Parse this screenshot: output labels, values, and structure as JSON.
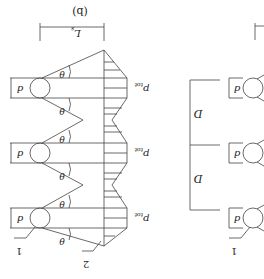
{
  "figure": {
    "orientation": "rotated 180 degrees",
    "panel_label": "(b)",
    "colors": {
      "stroke": "#444444",
      "text": "#222222",
      "background": "#ffffff"
    }
  },
  "panel_b": {
    "spacing_label": "L_s",
    "spacing_label_main": "L",
    "spacing_label_sub": "s",
    "diameter_label": "d",
    "angle_label": "θ",
    "pressure_label": "p",
    "pressure_label_sub": "tot",
    "callout_pile": "1",
    "callout_pressure": "2",
    "pile_count": 3
  },
  "panel_a": {
    "spacing_label": "D",
    "diameter_label": "d",
    "callout_pile": "1",
    "pile_count": 3
  }
}
